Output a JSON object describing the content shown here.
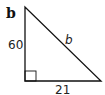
{
  "diagram": {
    "type": "right-triangle",
    "problem_label": "b",
    "legs": {
      "vertical": {
        "label": "60"
      },
      "horizontal": {
        "label": "21"
      }
    },
    "hypotenuse": {
      "label": "b"
    },
    "right_angle_marker": "bottom-left",
    "colors": {
      "stroke": "#111111",
      "background": "#ffffff"
    }
  }
}
